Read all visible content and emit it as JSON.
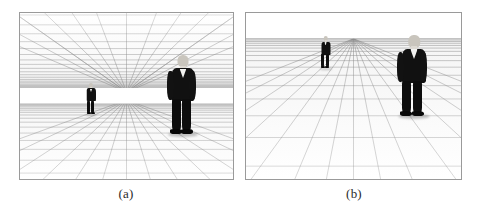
{
  "figure": {
    "background_color": "#ffffff",
    "panel_border_color": "#9a9a9a",
    "grid_line_color": "#8d8d8d",
    "suit_color": "#111111",
    "skin_color": "#c9c5bd",
    "shirt_color": "#f2f2f0"
  },
  "panels": [
    {
      "id": "a",
      "caption": "(a)",
      "scene_type": "enclosed-corridor-room",
      "description": "One-point perspective room with dense receding ceiling grid above and floor grid below, separated by a bright horizon band",
      "has_ceiling_grid": true,
      "has_floor_grid": true,
      "horizon_band": true,
      "vanishing_point": {
        "x_pct": 50,
        "y_pct": 45
      },
      "people": [
        {
          "label": "far-person",
          "position": "left",
          "scale": "small",
          "x_pct": 33,
          "ground_y_pct": 60
        },
        {
          "label": "near-person",
          "position": "right",
          "scale": "large",
          "x_pct": 73,
          "ground_y_pct": 73
        }
      ]
    },
    {
      "id": "b",
      "caption": "(b)",
      "scene_type": "open-ground-plane",
      "description": "One-point perspective open floor grid meeting a plain sky at the horizon line, no ceiling",
      "has_ceiling_grid": false,
      "has_floor_grid": true,
      "horizon_band": false,
      "vanishing_point": {
        "x_pct": 50,
        "y_pct": 16
      },
      "people": [
        {
          "label": "far-person",
          "position": "left",
          "scale": "small",
          "x_pct": 34,
          "ground_y_pct": 34
        },
        {
          "label": "near-person",
          "position": "right",
          "scale": "large",
          "x_pct": 74,
          "ground_y_pct": 62
        }
      ]
    }
  ]
}
